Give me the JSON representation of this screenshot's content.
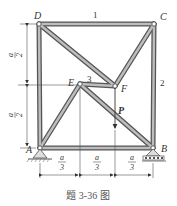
{
  "figure": {
    "caption": "题 3-36 图",
    "nodes": {
      "D": {
        "label": "D",
        "x": 39,
        "y": 24
      },
      "C": {
        "label": "C",
        "x": 154,
        "y": 24
      },
      "A": {
        "label": "A",
        "x": 40,
        "y": 148
      },
      "B": {
        "label": "B",
        "x": 153,
        "y": 148
      },
      "E": {
        "label": "E",
        "x": 80,
        "y": 84
      },
      "F": {
        "label": "F",
        "x": 115,
        "y": 86
      }
    },
    "member_labels": {
      "m1": "1",
      "m2": "2",
      "m3": "3"
    },
    "load": {
      "label": "P"
    },
    "dimensions": {
      "vertical_top": {
        "num": "a",
        "den": "2"
      },
      "vertical_bottom": {
        "num": "a",
        "den": "2"
      },
      "horizontal": [
        {
          "num": "a",
          "den": "3"
        },
        {
          "num": "a",
          "den": "3"
        },
        {
          "num": "a",
          "den": "3"
        }
      ]
    }
  }
}
